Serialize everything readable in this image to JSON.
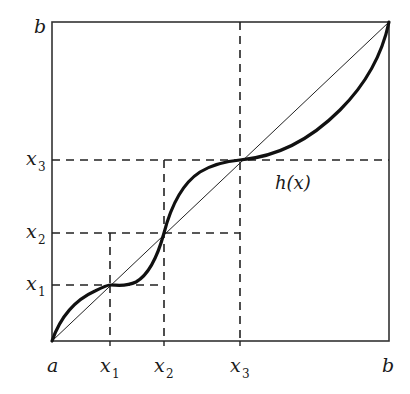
{
  "diagram": {
    "type": "fixed-point-function-plot",
    "frame": {
      "left": 52,
      "top": 22,
      "right": 389,
      "bottom": 341
    },
    "axis_labels": {
      "x_start": "a",
      "x_end": "b",
      "y_end": "b",
      "x_ticks": [
        {
          "base": "x",
          "sub": "1"
        },
        {
          "base": "x",
          "sub": "2"
        },
        {
          "base": "x",
          "sub": "3"
        }
      ],
      "y_ticks": [
        {
          "base": "x",
          "sub": "1"
        },
        {
          "base": "x",
          "sub": "2"
        },
        {
          "base": "x",
          "sub": "3"
        }
      ]
    },
    "curve_label": "h(x)",
    "fixed_points_px": [
      {
        "name": "x1",
        "x": 110,
        "y": 285
      },
      {
        "name": "x2",
        "x": 164,
        "y": 233
      },
      {
        "name": "x3",
        "x": 240,
        "y": 160
      }
    ],
    "colors": {
      "ink": "#1a1a1a",
      "background": "#ffffff"
    }
  }
}
